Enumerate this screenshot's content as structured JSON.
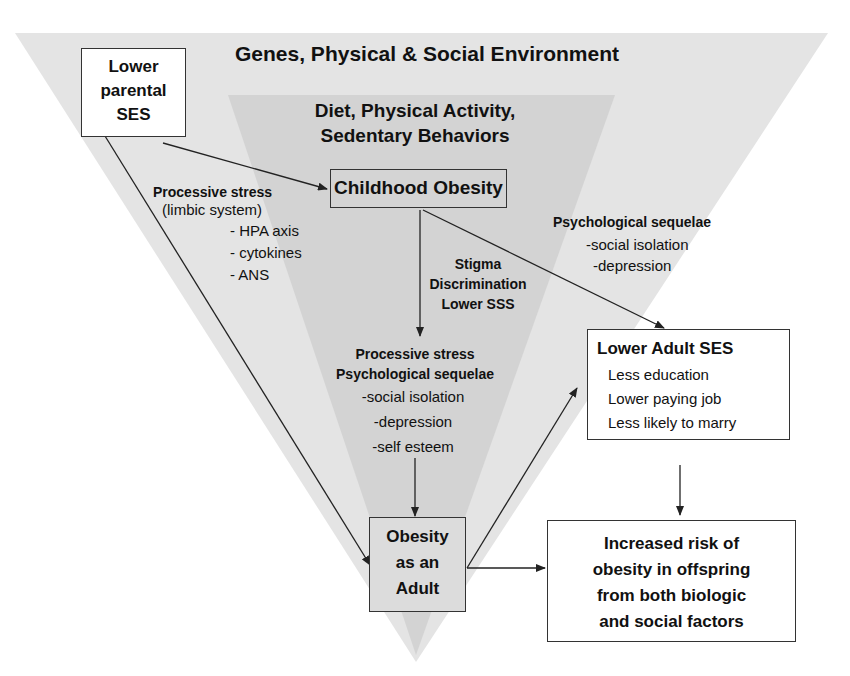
{
  "diagram": {
    "outer_label": "Genes, Physical & Social Environment",
    "inner_label": [
      "Diet, Physical Activity,",
      "Sedentary Behaviors"
    ],
    "nodes": {
      "lower_parental_ses": [
        "Lower",
        "parental",
        "SES"
      ],
      "childhood_obesity": "Childhood Obesity",
      "obesity_adult": [
        "Obesity",
        "as an",
        "Adult"
      ],
      "lower_adult_ses": {
        "title": "Lower Adult SES",
        "items": [
          "Less education",
          "Lower paying job",
          "Less likely to marry"
        ]
      },
      "offspring_risk": [
        "Increased risk of",
        "obesity in offspring",
        "from both biologic",
        "and social factors"
      ]
    },
    "annotations": {
      "processive_stress_left": {
        "title": "Processive stress",
        "subtitle": "(limbic system)",
        "items": [
          "-  HPA axis",
          "-  cytokines",
          "-  ANS"
        ]
      },
      "stigma": [
        "Stigma",
        "Discrimination",
        "Lower SSS"
      ],
      "psych_right": {
        "title": "Psychological sequelae",
        "items": [
          "-social isolation",
          "-depression"
        ]
      },
      "processive_center": {
        "titles": [
          "Processive stress",
          "Psychological sequelae"
        ],
        "items": [
          "-social isolation",
          "-depression",
          "-self esteem"
        ]
      }
    },
    "colors": {
      "outer_triangle": "#e4e4e4",
      "inner_triangle": "#cfcfcf",
      "stroke": "#333333"
    }
  }
}
